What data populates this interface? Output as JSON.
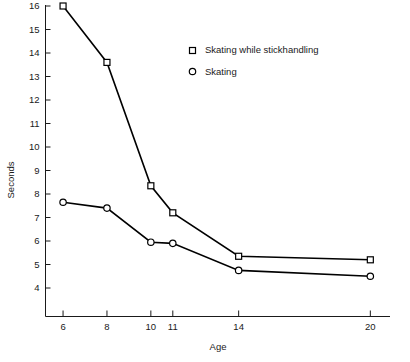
{
  "chart_data": {
    "type": "line",
    "title": "",
    "xlabel": "Age",
    "ylabel": "Seconds",
    "x": [
      6,
      8,
      10,
      11,
      14,
      20
    ],
    "xtick_labels": [
      "6",
      "8",
      "10",
      "11",
      "14",
      "20"
    ],
    "xlim": [
      5.2,
      20.6
    ],
    "ylim": [
      3.4,
      16.0
    ],
    "ytick_labels": [
      "16",
      "15",
      "14",
      "13",
      "12",
      "11",
      "10",
      "9",
      "8",
      "7",
      "6",
      "5",
      "4"
    ],
    "yticks": [
      16,
      15,
      14,
      13,
      12,
      11,
      10,
      9,
      8,
      7,
      6,
      5,
      4
    ],
    "grid": false,
    "legend_position": "top-center",
    "series": [
      {
        "name": "Skating while stickhandling",
        "marker": "open-square",
        "values": [
          16.0,
          13.6,
          8.35,
          7.2,
          5.35,
          5.2
        ]
      },
      {
        "name": "Skating",
        "marker": "open-circle",
        "values": [
          7.65,
          7.4,
          5.95,
          5.9,
          4.75,
          4.5
        ]
      }
    ]
  },
  "legend": {
    "entries": [
      {
        "label": "Skating while stickhandling",
        "marker": "square-marker-icon"
      },
      {
        "label": "Skating",
        "marker": "circle-marker-icon"
      }
    ]
  },
  "colors": {
    "line": "#000000",
    "axis": "#1a1a1a",
    "background": "#ffffff",
    "marker_fill": "#ffffff"
  }
}
